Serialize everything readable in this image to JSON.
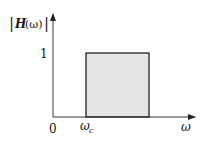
{
  "diagram": {
    "type": "ideal-high-pass-filter-magnitude-response",
    "y_axis_label": {
      "prefix": "|",
      "func": "H",
      "arg": "(ω)",
      "suffix": "|"
    },
    "x_axis_label": "ω",
    "origin_label": "0",
    "cutoff_label": {
      "symbol": "ω",
      "subscript": "c"
    },
    "level_label": "1",
    "colors": {
      "axis": "#222222",
      "box_fill": "#e4e4e4",
      "box_stroke": "#222222"
    }
  }
}
